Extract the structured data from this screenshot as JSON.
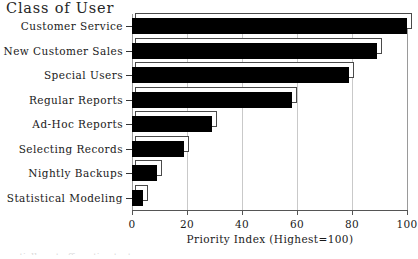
{
  "chart_data": {
    "type": "bar",
    "orientation": "horizontal",
    "title": "Class of User",
    "xlabel": "Priority Index (Highest=100)",
    "ylabel": "Class of User",
    "categories": [
      "Customer Service",
      "New Customer Sales",
      "Special Users",
      "Regular Reports",
      "Ad-Hoc Reports",
      "Selecting Records",
      "Nightly Backups",
      "Statistical Modeling"
    ],
    "values": [
      100,
      89,
      79,
      58,
      29,
      19,
      9,
      4
    ],
    "xlim": [
      0,
      100
    ],
    "xticks": [
      0,
      20,
      40,
      60,
      80,
      100
    ],
    "xtick_labels": [
      "0",
      "20",
      "40",
      "60",
      "80",
      "100"
    ],
    "grid": true,
    "grid_axis": "x",
    "legend": null,
    "bar_color": "#000000",
    "bar_style": "3d-shadow",
    "background_color": "#ffffff"
  },
  "caption_sliver": "partially cut off caption text"
}
